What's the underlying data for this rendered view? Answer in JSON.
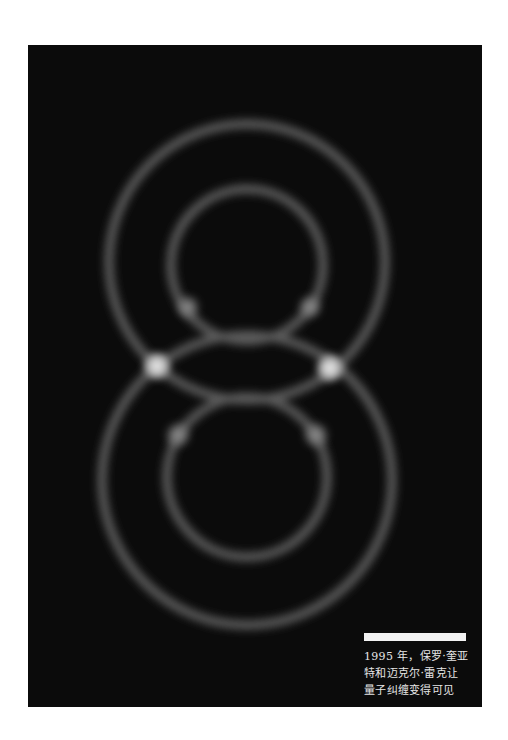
{
  "figure": {
    "background_color": "#0b0b0b",
    "ring_color": "#6a6a6a",
    "spot_color": "#e8e8e8",
    "caption": {
      "text": "1995 年，保罗·奎亚特和迈克尔·雷克让量子纠缠变得可见",
      "line1": "1995 年，保罗·奎亚",
      "line2": "特和迈克尔·雷克让",
      "line3": "量子纠缠变得可见"
    }
  }
}
